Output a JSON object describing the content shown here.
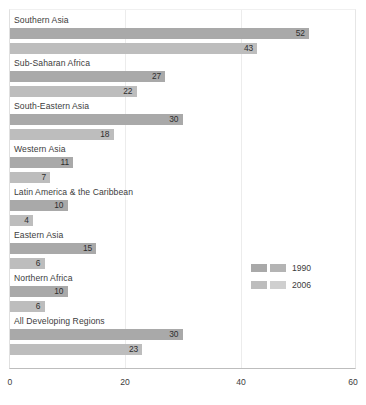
{
  "chart_data": {
    "type": "bar",
    "orientation": "horizontal",
    "title": "",
    "subtitle": "",
    "xlabel": "",
    "ylabel": "",
    "xlim": [
      0,
      60
    ],
    "xticks": [
      0,
      20,
      40,
      60
    ],
    "xtick_labels": [
      "0",
      "20",
      "40",
      "60"
    ],
    "grid": true,
    "gridlines_at": [
      20,
      40
    ],
    "legend_position": "center-right",
    "categories": [
      "Southern Asia",
      "Sub-Saharan Africa",
      "South-Eastern Asia",
      "Western Asia",
      "Latin America & the Caribbean",
      "Eastern Asia",
      "Northern Africa",
      "All Developing Regions"
    ],
    "series": [
      {
        "name": "1990",
        "color": "#a9a9a9",
        "values": [
          52,
          27,
          30,
          11,
          10,
          15,
          10,
          30
        ]
      },
      {
        "name": "2006",
        "color": "#bdbdbd",
        "values": [
          43,
          22,
          18,
          7,
          4,
          6,
          6,
          23
        ]
      }
    ]
  },
  "legend": {
    "entries": [
      {
        "label": "1990",
        "color_a": "#a9a9a9",
        "color_b": "#b4b4b4"
      },
      {
        "label": "2006",
        "color_a": "#bdbdbd",
        "color_b": "#cfcfcf"
      }
    ]
  },
  "axis": {
    "x_tick_0": "0",
    "x_tick_1": "20",
    "x_tick_2": "40",
    "x_tick_3": "60"
  }
}
